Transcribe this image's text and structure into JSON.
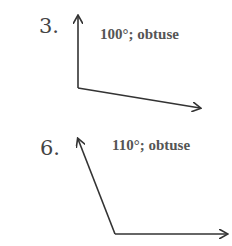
{
  "problems": [
    {
      "number": "3.",
      "answer": "100°; obtuse",
      "angle_degrees": 100,
      "classification": "obtuse"
    },
    {
      "number": "6.",
      "answer": "110°; obtuse",
      "angle_degrees": 110,
      "classification": "obtuse"
    }
  ],
  "colors": {
    "ink": "#333333",
    "text": "#555555"
  }
}
